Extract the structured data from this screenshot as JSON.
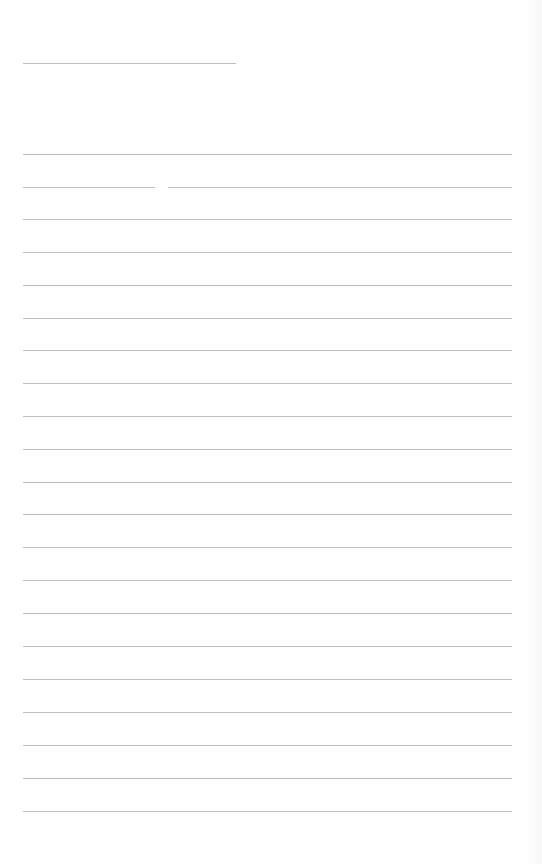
{
  "page": {
    "type": "lined-form",
    "background_color": "#ffffff",
    "line_color": "#a9a9a9"
  },
  "header": {
    "rule_x": 23,
    "rule_y": 63,
    "rule_width": 213
  },
  "ruled_lines": {
    "left": 23,
    "width": 489,
    "positions_y": [
      154,
      187,
      219,
      252,
      285,
      318,
      350,
      383,
      416,
      449,
      482,
      514,
      547,
      580,
      613,
      646,
      679,
      712,
      745,
      778,
      811
    ],
    "split_line_index": 1,
    "split_gap": {
      "from_x": 155,
      "to_x": 168
    }
  }
}
